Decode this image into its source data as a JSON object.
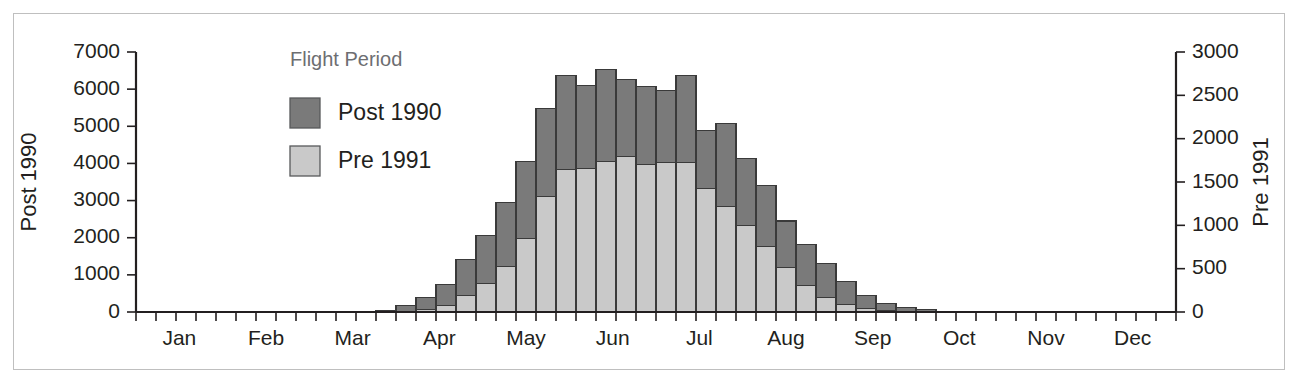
{
  "chart_data": {
    "type": "bar",
    "stacked": true,
    "title": "",
    "xlabel": "",
    "ylabel": "Post 1990",
    "y2label": "Pre 1991",
    "ylim": [
      0,
      7000
    ],
    "y2lim": [
      0,
      3000
    ],
    "yticks": [
      0,
      1000,
      2000,
      3000,
      4000,
      5000,
      6000,
      7000
    ],
    "y2ticks": [
      0,
      500,
      1000,
      1500,
      2000,
      2500,
      3000
    ],
    "grid": false,
    "legend_title": "Flight Period",
    "legend_position": "top-left-inside",
    "xtick_labels": [
      "Jan",
      "Feb",
      "Mar",
      "Apr",
      "May",
      "Jun",
      "Jul",
      "Aug",
      "Sep",
      "Oct",
      "Nov",
      "Dec"
    ],
    "x_axis_note": "52 weekly bins across the year; month names centred on their weeks",
    "n_bins": 52,
    "series": [
      {
        "name": "Pre 1991",
        "color": "#c9c9c9",
        "axis": "right",
        "axis_max": 3000,
        "values": [
          0,
          0,
          0,
          0,
          0,
          0,
          0,
          0,
          0,
          0,
          0,
          0,
          0,
          10,
          30,
          80,
          190,
          330,
          520,
          850,
          1330,
          1640,
          1660,
          1740,
          1790,
          1700,
          1720,
          1730,
          1430,
          1220,
          1000,
          760,
          510,
          310,
          170,
          90,
          45,
          20,
          10,
          5,
          0,
          0,
          0,
          0,
          0,
          0,
          0,
          0,
          0,
          0,
          0,
          0
        ]
      },
      {
        "name": "Post 1990",
        "color": "#7a7a7a",
        "axis": "left",
        "axis_max": 7000,
        "values": [
          0,
          0,
          0,
          0,
          0,
          0,
          0,
          0,
          0,
          0,
          0,
          0,
          50,
          140,
          320,
          560,
          960,
          1300,
          1730,
          2080,
          2370,
          2540,
          2230,
          2470,
          2080,
          2100,
          1960,
          2330,
          1560,
          2230,
          1790,
          1630,
          1260,
          1100,
          900,
          620,
          340,
          190,
          100,
          45,
          20,
          10,
          0,
          0,
          0,
          0,
          0,
          0,
          0,
          0,
          0,
          0
        ]
      }
    ],
    "totals_post1990_scale": [
      0,
      0,
      0,
      0,
      0,
      0,
      0,
      0,
      0,
      0,
      0,
      0,
      50,
      163,
      390,
      747,
      1403,
      2070,
      2943,
      4063,
      5473,
      6367,
      6103,
      6530,
      6257,
      6067,
      5973,
      6367,
      4897,
      5077,
      4123,
      3403,
      2450,
      1823,
      1297,
      830,
      445,
      237,
      123,
      57,
      20,
      10,
      0,
      0,
      0,
      0,
      0,
      0,
      0,
      0,
      0,
      0
    ]
  },
  "axes": {
    "left_title": "Post 1990",
    "right_title": "Pre 1991"
  },
  "legend": {
    "title": "Flight Period",
    "items": [
      {
        "label": "Post 1990",
        "color": "#7a7a7a"
      },
      {
        "label": "Pre 1991",
        "color": "#c9c9c9"
      }
    ]
  }
}
